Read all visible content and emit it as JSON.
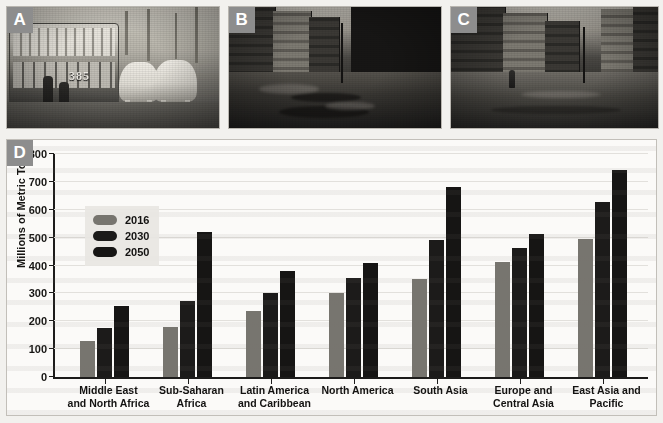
{
  "figure": {
    "panels": [
      {
        "tag": "A",
        "name": "photo-horse-drawn-tram"
      },
      {
        "tag": "B",
        "name": "photo-unpaved-muddy-street"
      },
      {
        "tag": "C",
        "name": "photo-city-street"
      },
      {
        "tag": "D",
        "name": "waste-generation-bar-chart"
      }
    ]
  },
  "photo_a": {
    "tram_number": "385"
  },
  "chart_data": {
    "type": "bar",
    "title": "",
    "xlabel": "",
    "ylabel": "Millions of Metric Tons",
    "ylim": [
      0,
      800
    ],
    "yticks": [
      0,
      100,
      200,
      300,
      400,
      500,
      600,
      700,
      800
    ],
    "ytick_labels": [
      "0",
      "100",
      "200",
      "300",
      "400",
      "500",
      "600",
      "700",
      "800"
    ],
    "grid": true,
    "legend_position": "upper-left-inside",
    "categories": [
      "Middle East and North Africa",
      "Sub-Saharan Africa",
      "Latin America and Caribbean",
      "North America",
      "South Asia",
      "Europe and Central Asia",
      "East Asia and Pacific"
    ],
    "category_label_lines": [
      [
        "Middle East",
        "and North Africa"
      ],
      [
        "Sub-Saharan",
        "Africa"
      ],
      [
        "Latin America",
        "and Caribbean"
      ],
      [
        "North America"
      ],
      [
        "South Asia"
      ],
      [
        "Europe and",
        "Central Asia"
      ],
      [
        "East Asia and",
        "Pacific"
      ]
    ],
    "series": [
      {
        "name": "2016",
        "color": "#77756f",
        "values": [
          130,
          180,
          238,
          303,
          350,
          413,
          495
        ]
      },
      {
        "name": "2030",
        "color": "#1c1b1a",
        "values": [
          177,
          272,
          300,
          355,
          490,
          462,
          627
        ]
      },
      {
        "name": "2050",
        "color": "#161514",
        "values": [
          255,
          522,
          380,
          410,
          680,
          513,
          743
        ]
      }
    ]
  }
}
